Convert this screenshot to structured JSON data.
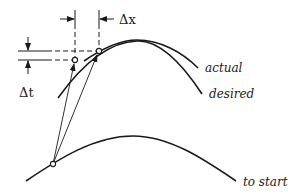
{
  "diagram": {
    "labels": {
      "delta_x": "Δx",
      "delta_t": "Δt",
      "actual": "actual",
      "desired": "desired",
      "to_start": "to start"
    },
    "colors": {
      "stroke": "#1a1a1a",
      "background": "#ffffff"
    }
  }
}
